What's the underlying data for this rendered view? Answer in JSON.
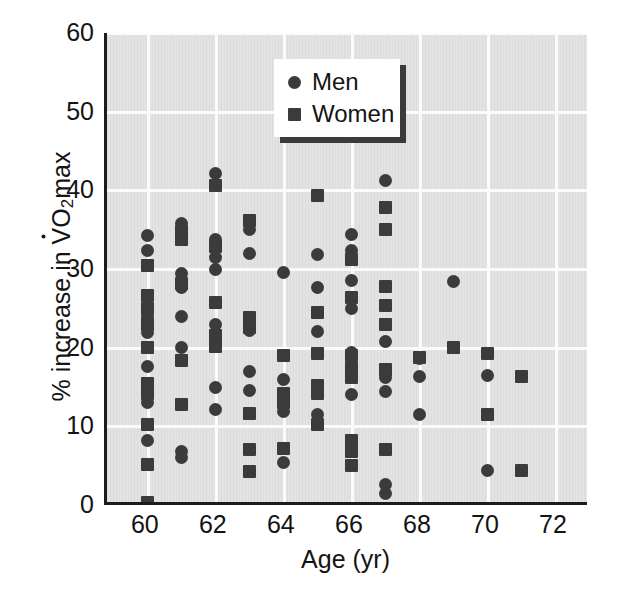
{
  "chart_data": {
    "type": "scatter",
    "title": "",
    "xlabel": "Age (yr)",
    "ylabel_plain": "% increase in VO2max",
    "ylabel_parts": {
      "prefix": "% increase in ",
      "v": "V",
      "o": "O",
      "sub": "2",
      "suffix": "max"
    },
    "xlim": [
      58.8,
      73.0
    ],
    "ylim": [
      0,
      60
    ],
    "xticks": [
      60,
      62,
      64,
      66,
      68,
      70,
      72
    ],
    "yticks": [
      0,
      10,
      20,
      30,
      40,
      50,
      60
    ],
    "grid": true,
    "legend_position": "top-center",
    "marker_color": "#3b3b3b",
    "plot_background": "#e3e3e3",
    "gridline_color": "#fbfbfb",
    "series": [
      {
        "name": "Men",
        "marker": "circle",
        "points": [
          [
            60,
            34.2
          ],
          [
            60,
            32.3
          ],
          [
            60,
            26.2
          ],
          [
            60,
            24.0
          ],
          [
            60,
            21.9
          ],
          [
            60,
            17.6
          ],
          [
            60,
            13.0
          ],
          [
            60,
            8.2
          ],
          [
            61,
            35.8
          ],
          [
            61,
            34.2
          ],
          [
            61,
            29.4
          ],
          [
            61,
            27.6
          ],
          [
            61,
            24.0
          ],
          [
            61,
            20.0
          ],
          [
            61,
            6.8
          ],
          [
            61,
            6.0
          ],
          [
            62,
            42.2
          ],
          [
            62,
            33.8
          ],
          [
            62,
            31.4
          ],
          [
            62,
            30.0
          ],
          [
            62,
            23.0
          ],
          [
            62,
            15.0
          ],
          [
            62,
            12.2
          ],
          [
            63,
            35.0
          ],
          [
            63,
            32.0
          ],
          [
            63,
            22.2
          ],
          [
            63,
            17.0
          ],
          [
            63,
            14.6
          ],
          [
            64,
            29.6
          ],
          [
            64,
            16.0
          ],
          [
            64,
            11.9
          ],
          [
            64,
            5.4
          ],
          [
            65,
            31.9
          ],
          [
            65,
            27.6
          ],
          [
            65,
            22.0
          ],
          [
            65,
            14.2
          ],
          [
            65,
            11.5
          ],
          [
            66,
            34.4
          ],
          [
            66,
            32.4
          ],
          [
            66,
            28.5
          ],
          [
            66,
            25.0
          ],
          [
            66,
            19.4
          ],
          [
            66,
            17.8
          ],
          [
            66,
            14.1
          ],
          [
            67,
            41.3
          ],
          [
            67,
            20.8
          ],
          [
            67,
            16.2
          ],
          [
            67,
            14.4
          ],
          [
            67,
            2.6
          ],
          [
            67,
            1.5
          ],
          [
            68,
            18.6
          ],
          [
            68,
            16.3
          ],
          [
            68,
            11.5
          ],
          [
            69,
            28.4
          ],
          [
            70,
            16.4
          ],
          [
            70,
            4.4
          ]
        ]
      },
      {
        "name": "Women",
        "marker": "square",
        "points": [
          [
            60,
            30.5
          ],
          [
            60,
            26.6
          ],
          [
            60,
            25.0
          ],
          [
            60,
            23.0
          ],
          [
            60,
            20.0
          ],
          [
            60,
            15.4
          ],
          [
            60,
            14.2
          ],
          [
            60,
            10.2
          ],
          [
            60,
            5.1
          ],
          [
            60,
            0.3
          ],
          [
            61,
            34.8
          ],
          [
            61,
            33.8
          ],
          [
            61,
            28.2
          ],
          [
            61,
            18.4
          ],
          [
            61,
            12.8
          ],
          [
            62,
            40.6
          ],
          [
            62,
            32.8
          ],
          [
            62,
            25.8
          ],
          [
            62,
            21.6
          ],
          [
            62,
            20.1
          ],
          [
            63,
            36.2
          ],
          [
            63,
            23.8
          ],
          [
            63,
            23.2
          ],
          [
            63,
            22.6
          ],
          [
            63,
            11.6
          ],
          [
            63,
            7.0
          ],
          [
            63,
            4.3
          ],
          [
            64,
            19.0
          ],
          [
            64,
            14.2
          ],
          [
            64,
            13.0
          ],
          [
            64,
            7.2
          ],
          [
            65,
            39.4
          ],
          [
            65,
            24.5
          ],
          [
            65,
            19.2
          ],
          [
            65,
            15.2
          ],
          [
            65,
            14.2
          ],
          [
            65,
            10.2
          ],
          [
            66,
            31.2
          ],
          [
            66,
            26.4
          ],
          [
            66,
            19.0
          ],
          [
            66,
            17.4
          ],
          [
            66,
            16.2
          ],
          [
            66,
            8.2
          ],
          [
            66,
            6.8
          ],
          [
            66,
            5.0
          ],
          [
            67,
            37.8
          ],
          [
            67,
            35.0
          ],
          [
            67,
            27.8
          ],
          [
            67,
            25.4
          ],
          [
            67,
            23.0
          ],
          [
            67,
            17.2
          ],
          [
            67,
            7.0
          ],
          [
            68,
            18.8
          ],
          [
            69,
            20.0
          ],
          [
            70,
            19.3
          ],
          [
            70,
            11.5
          ],
          [
            71,
            16.3
          ],
          [
            71,
            4.4
          ]
        ]
      }
    ]
  },
  "legend": {
    "entries": [
      {
        "label": "Men",
        "marker": "circle"
      },
      {
        "label": "Women",
        "marker": "square"
      }
    ]
  }
}
